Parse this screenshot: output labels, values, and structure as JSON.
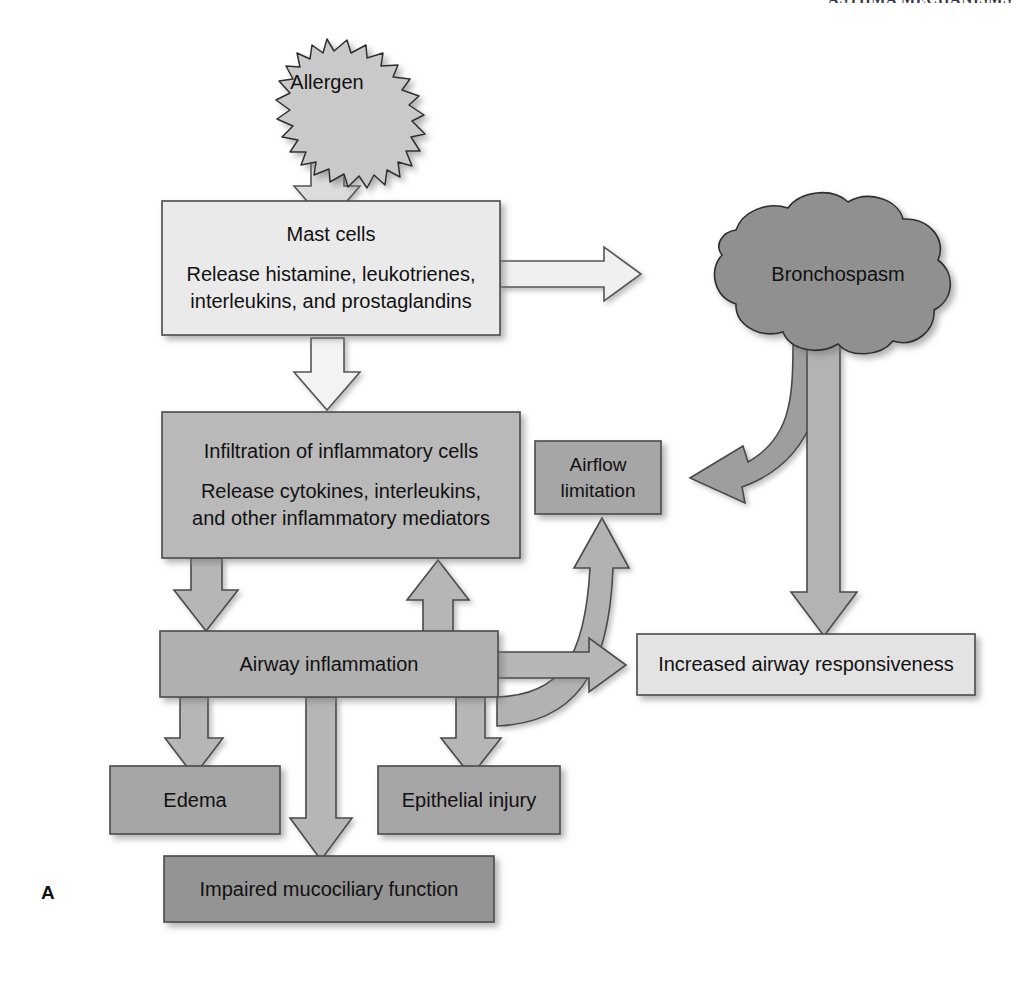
{
  "figure": {
    "panel_letter": "A",
    "header_text": "ASTHMA MECHANISMS",
    "palette": {
      "very_light_gray": "#e9e9e9",
      "light_gray": "#d8d8d8",
      "mid_gray": "#b8b8b8",
      "medium_gray": "#a8a8a8",
      "dark_gray": "#9a9a9a",
      "darker_gray": "#8e8e8e",
      "outline": "#3c3c3c",
      "white_arrow": "#efefef",
      "background": "#ffffff"
    }
  },
  "nodes": {
    "allergen": {
      "label": "Allergen",
      "shape": "starburst-ellipse",
      "fill": "#c9c9c9"
    },
    "mast_cells": {
      "shape": "rect",
      "fill": "#eaeaea",
      "line1": "Mast cells",
      "line2": "Release histamine, leukotrienes,",
      "line3": "interleukins, and prostaglandins"
    },
    "bronchospasm": {
      "label": "Bronchospasm",
      "shape": "cloud",
      "fill": "#909090"
    },
    "infiltration": {
      "shape": "rect",
      "fill": "#b9b9b9",
      "line1": "Infiltration of inflammatory cells",
      "line2": "Release cytokines, interleukins,",
      "line3": "and other inflammatory mediators"
    },
    "airflow_limitation": {
      "shape": "rect",
      "fill": "#a6a6a6",
      "line1": "Airflow",
      "line2": "limitation"
    },
    "airway_inflammation": {
      "shape": "rect",
      "fill": "#b0b0b0",
      "label": "Airway inflammation"
    },
    "increased_responsiveness": {
      "shape": "rect",
      "fill": "#e3e3e3",
      "label": "Increased airway responsiveness"
    },
    "edema": {
      "shape": "rect",
      "fill": "#a6a6a6",
      "label": "Edema"
    },
    "epithelial_injury": {
      "shape": "rect",
      "fill": "#a6a6a6",
      "label": "Epithelial injury"
    },
    "impaired_mucociliary": {
      "shape": "rect",
      "fill": "#949494",
      "label": "Impaired mucociliary function"
    }
  },
  "edges": [
    {
      "name": "allergen-to-mast-cells",
      "from": "allergen",
      "to": "mast_cells",
      "style": "block-arrow-down",
      "fill": "#d9d9d9"
    },
    {
      "name": "mast-cells-to-bronchospasm",
      "from": "mast_cells",
      "to": "bronchospasm",
      "style": "block-arrow-right",
      "fill": "#efefef"
    },
    {
      "name": "mast-cells-to-infiltration",
      "from": "mast_cells",
      "to": "infiltration",
      "style": "block-arrow-down",
      "fill": "#f2f2f2"
    },
    {
      "name": "infiltration-to-airway-inflammation",
      "from": "infiltration",
      "to": "airway_inflammation",
      "style": "block-arrow-down",
      "fill": "#b4b4b4"
    },
    {
      "name": "bronchospasm-to-airflow-limitation",
      "from": "bronchospasm",
      "to": "airflow_limitation",
      "style": "curved-block-arrow-left",
      "fill": "#9e9e9e"
    },
    {
      "name": "bronchospasm-to-increased-responsiveness",
      "from": "bronchospasm",
      "to": "increased_responsiveness",
      "style": "block-arrow-down",
      "fill": "#b2b2b2"
    },
    {
      "name": "airway-inflammation-to-airflow-limitation",
      "from": "airway_inflammation",
      "to": "airflow_limitation",
      "style": "curved-block-arrow-up",
      "fill": "#b0b0b0"
    },
    {
      "name": "airway-inflammation-to-increased-responsiveness",
      "from": "airway_inflammation",
      "to": "increased_responsiveness",
      "style": "block-arrow-right",
      "fill": "#b4b4b4"
    },
    {
      "name": "airway-inflammation-to-infiltration",
      "from": "airway_inflammation",
      "to": "infiltration",
      "style": "block-arrow-up",
      "fill": "#b4b4b4"
    },
    {
      "name": "airway-inflammation-to-edema",
      "from": "airway_inflammation",
      "to": "edema",
      "style": "block-arrow-down",
      "fill": "#b4b4b4"
    },
    {
      "name": "airway-inflammation-to-impaired-mucociliary",
      "from": "airway_inflammation",
      "to": "impaired_mucociliary",
      "style": "block-arrow-down",
      "fill": "#b4b4b4"
    },
    {
      "name": "airway-inflammation-to-epithelial-injury",
      "from": "airway_inflammation",
      "to": "epithelial_injury",
      "style": "block-arrow-down",
      "fill": "#b4b4b4"
    }
  ]
}
